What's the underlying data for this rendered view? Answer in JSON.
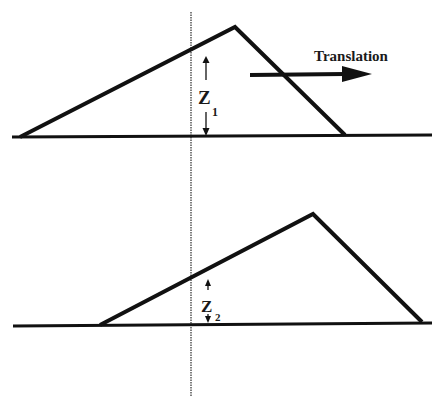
{
  "diagram": {
    "top_panel": {
      "label_z": "Z",
      "label_sub": "1",
      "translation_label": "Translation"
    },
    "bottom_panel": {
      "label_z": "Z",
      "label_sub": "2"
    },
    "colors": {
      "stroke": "#111111",
      "dotted_line": "#555555",
      "background": "#ffffff"
    }
  }
}
